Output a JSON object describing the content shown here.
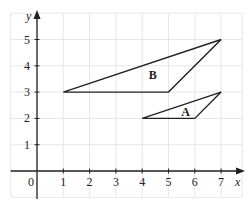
{
  "chart_data": {
    "type": "diagram",
    "title": "",
    "xlabel": "x",
    "ylabel": "y",
    "origin_label": "0",
    "xlim": [
      -1,
      7.8
    ],
    "ylim": [
      -1,
      6
    ],
    "grid": true,
    "x_ticks": [
      "1",
      "2",
      "3",
      "4",
      "5",
      "6",
      "7"
    ],
    "y_ticks": [
      "1",
      "2",
      "3",
      "4",
      "5"
    ],
    "shapes": [
      {
        "label": "A",
        "vertices": [
          [
            4,
            2
          ],
          [
            6,
            2
          ],
          [
            7,
            3
          ]
        ],
        "label_pos": [
          5.65,
          2.25
        ]
      },
      {
        "label": "B",
        "vertices": [
          [
            1,
            3
          ],
          [
            5,
            3
          ],
          [
            7,
            5
          ]
        ],
        "label_pos": [
          4.4,
          3.65
        ]
      }
    ]
  },
  "colors": {
    "grid": "#e6e6e6",
    "axis": "#222222",
    "shape_stroke": "#222222",
    "background": "#ffffff"
  }
}
